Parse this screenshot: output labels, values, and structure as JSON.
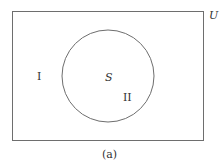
{
  "diagram": {
    "type": "venn",
    "universe_label": "U",
    "set_label": "S",
    "region_outside_label": "I",
    "region_inside_label": "II",
    "caption": "(a)",
    "stroke_color": "#6e6e6e"
  }
}
